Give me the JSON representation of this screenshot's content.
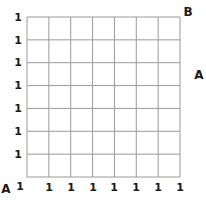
{
  "diagram": {
    "type": "grid",
    "rows": 7,
    "cols": 7,
    "line_color": "#9a9a9a",
    "grid": {
      "left": 27,
      "top": 17,
      "right": 180,
      "bottom": 177
    },
    "y_labels": [
      "1",
      "1",
      "1",
      "1",
      "1",
      "1",
      "1"
    ],
    "x_labels": [
      "1",
      "1",
      "1",
      "1",
      "1",
      "1",
      "1",
      "1"
    ],
    "corner_labels": {
      "top_right": "B",
      "right_middle": "A",
      "bottom_left": "A"
    }
  }
}
